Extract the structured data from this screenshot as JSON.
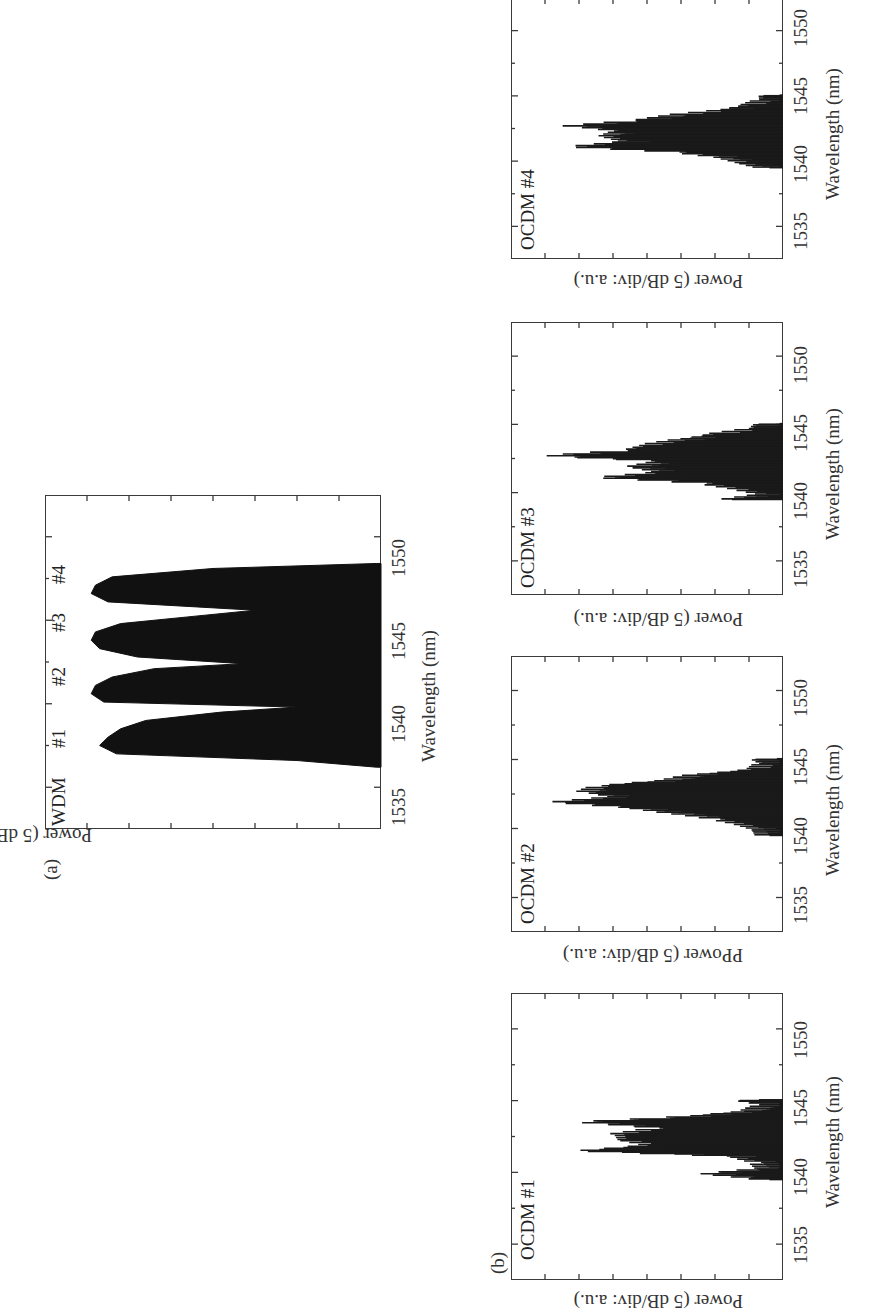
{
  "figure": {
    "orientation": "rotated 90 degrees counter-clockwise",
    "panel_a_letter": "(a)",
    "panel_b_letter": "(b)"
  },
  "axes": {
    "xlabel": "Wavelength (nm)",
    "ylabel": "Power (5 dB/div: a.u.)",
    "ylabel_ocdm2": "PPower (5 dB/div: a.u.)",
    "xticks": [
      "1535",
      "1540",
      "1545",
      "1550"
    ],
    "xlim": [
      1532.5,
      1552.5
    ],
    "power_divisions": 7
  },
  "panels": {
    "wdm": {
      "name": "WDM",
      "channel_labels": [
        "#1",
        "#2",
        "#3",
        "#4"
      ]
    },
    "ocdm1": {
      "name": "OCDM #1"
    },
    "ocdm2": {
      "name": "OCDM #2"
    },
    "ocdm3": {
      "name": "OCDM #3"
    },
    "ocdm4": {
      "name": "OCDM #4"
    }
  },
  "chart_data": [
    {
      "type": "area",
      "panel": "(a)",
      "title": "WDM",
      "xlabel": "Wavelength (nm)",
      "ylabel": "Power (5 dB/div: a.u.)",
      "xlim": [
        1532.5,
        1552.5
      ],
      "xticks": [
        1535,
        1540,
        1545,
        1550
      ],
      "annotations": [
        "#1",
        "#2",
        "#3",
        "#4"
      ],
      "series": [
        {
          "name": "WDM spectrum (relative power, div below top)",
          "x": [
            1536.2,
            1536.6,
            1537.0,
            1537.5,
            1538.0,
            1538.5,
            1539.0,
            1539.5,
            1539.8,
            1540.1,
            1540.6,
            1541.1,
            1541.6,
            1542.1,
            1542.4,
            1542.8,
            1543.3,
            1543.8,
            1544.3,
            1544.8,
            1545.2,
            1545.6,
            1546.1,
            1546.6,
            1547.1,
            1547.6,
            1548.1,
            1548.4
          ],
          "values": [
            -6.9,
            -5.0,
            -0.7,
            -0.3,
            -0.5,
            -0.8,
            -1.4,
            -3.2,
            -5.0,
            -0.4,
            -0.1,
            -0.2,
            -0.6,
            -1.6,
            -3.7,
            -1.2,
            -0.3,
            -0.1,
            -0.2,
            -0.8,
            -2.4,
            -4.0,
            -0.5,
            -0.1,
            -0.2,
            -0.6,
            -3.0,
            -6.9
          ]
        }
      ],
      "channel_peaks_nm": {
        "#1": 1537.5,
        "#2": 1540.6,
        "#3": 1543.8,
        "#4": 1546.6
      }
    },
    {
      "type": "line",
      "panel": "(b)",
      "title": "OCDM #1",
      "xlabel": "Wavelength (nm)",
      "ylabel": "Power (5 dB/div: a.u.)",
      "xlim": [
        1532.5,
        1552.5
      ],
      "xticks": [
        1535,
        1540,
        1545,
        1550
      ],
      "series": [
        {
          "name": "OCDM #1",
          "x": [
            1539.5,
            1539.9,
            1540.3,
            1540.7,
            1541.1,
            1541.5,
            1541.9,
            1542.3,
            1542.7,
            1543.1,
            1543.5,
            1543.9,
            1544.3,
            1544.7,
            1545.1
          ],
          "values": [
            -6.6,
            -5.0,
            -6.6,
            -6.4,
            -5.8,
            -1.2,
            -3.3,
            -2.5,
            -2.4,
            -3.5,
            -1.2,
            -4.4,
            -6.2,
            -6.6,
            -5.7
          ]
        }
      ]
    },
    {
      "type": "line",
      "panel": "(b)",
      "title": "OCDM #2",
      "xlabel": "Wavelength (nm)",
      "ylabel": "PPower (5 dB/div: a.u.)",
      "xlim": [
        1532.5,
        1552.5
      ],
      "xticks": [
        1535,
        1540,
        1545,
        1550
      ],
      "series": [
        {
          "name": "OCDM #2",
          "x": [
            1539.5,
            1539.9,
            1540.3,
            1540.7,
            1541.1,
            1541.5,
            1541.9,
            1542.3,
            1542.7,
            1543.1,
            1543.5,
            1543.9,
            1544.3,
            1544.7,
            1545.1
          ],
          "values": [
            -6.6,
            -6.5,
            -6.0,
            -5.2,
            -4.0,
            -2.8,
            -0.5,
            -2.2,
            -1.4,
            -1.8,
            -3.8,
            -4.6,
            -6.4,
            -6.6,
            -6.3
          ]
        }
      ]
    },
    {
      "type": "line",
      "panel": "(b)",
      "title": "OCDM #3",
      "xlabel": "Wavelength (nm)",
      "ylabel": "Power (5 dB/div: a.u.)",
      "xlim": [
        1532.5,
        1552.5
      ],
      "xticks": [
        1535,
        1540,
        1545,
        1550
      ],
      "series": [
        {
          "name": "OCDM #3",
          "x": [
            1539.5,
            1539.9,
            1540.3,
            1540.7,
            1541.1,
            1541.5,
            1541.9,
            1542.3,
            1542.7,
            1543.1,
            1543.5,
            1543.9,
            1544.3,
            1544.7,
            1545.1
          ],
          "values": [
            -5.5,
            -6.6,
            -5.8,
            -4.8,
            -1.8,
            -3.6,
            -2.8,
            -3.6,
            -0.2,
            -2.6,
            -3.2,
            -4.2,
            -5.2,
            -6.3,
            -6.5
          ]
        }
      ]
    },
    {
      "type": "line",
      "panel": "(b)",
      "title": "OCDM #4",
      "xlabel": "Wavelength (nm)",
      "ylabel": "Power (5 dB/div: a.u.)",
      "xlim": [
        1532.5,
        1552.5
      ],
      "xticks": [
        1535,
        1540,
        1545,
        1550
      ],
      "series": [
        {
          "name": "OCDM #4",
          "x": [
            1539.5,
            1539.9,
            1540.3,
            1540.7,
            1541.1,
            1541.5,
            1541.9,
            1542.3,
            1542.7,
            1543.1,
            1543.5,
            1543.9,
            1544.3,
            1544.7,
            1545.1
          ],
          "values": [
            -6.6,
            -6.0,
            -5.4,
            -4.0,
            -1.0,
            -2.6,
            -2.0,
            -2.4,
            -1.0,
            -2.8,
            -3.8,
            -5.4,
            -6.2,
            -6.6,
            -6.6
          ]
        }
      ]
    }
  ]
}
